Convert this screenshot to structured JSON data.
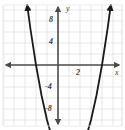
{
  "figure": {
    "name": "parabola-graph",
    "background_color": "#ffffff",
    "grid_color": "#dcdcdc",
    "axis_color": "#4a4a4a",
    "curve_color": "#1a1a1a",
    "plot_area": {
      "left": 4,
      "top": 5,
      "right": 122,
      "bottom": 126
    }
  },
  "axes": {
    "x_axis_label": "x",
    "y_axis_label": "y",
    "origin_px": {
      "x": 58,
      "y": 65
    },
    "unit_px": 11,
    "x_ticks": [
      {
        "value": 2,
        "label": "2"
      }
    ],
    "y_ticks": [
      {
        "value": 8,
        "label": "8"
      },
      {
        "value": 4,
        "label": "4"
      },
      {
        "value": -4,
        "label": "-4"
      },
      {
        "value": -8,
        "label": "-8"
      }
    ]
  },
  "chart_data": {
    "type": "line",
    "title": "",
    "subtitle": "",
    "xlabel": "x",
    "ylabel": "y",
    "xlim": [
      -5,
      6
    ],
    "ylim": [
      -11,
      11
    ],
    "grid": true,
    "legend": null,
    "series": [
      {
        "name": "y = x^2 - 2x - 8",
        "equation": "y = x^2 - 2x - 8",
        "vertex": [
          1,
          -9
        ],
        "roots": [
          -2,
          4
        ],
        "y_intercept": -8,
        "x": [
          -2.8,
          -2.5,
          -2,
          -1.5,
          -1,
          -0.5,
          0,
          0.5,
          1,
          1.5,
          2,
          2.5,
          3,
          3.5,
          4,
          4.5,
          4.8
        ],
        "values": [
          5.44,
          3.25,
          0,
          -2.75,
          -5,
          -6.75,
          -8,
          -8.75,
          -9,
          -8.75,
          -8,
          -6.75,
          -5,
          -2.75,
          0,
          3.25,
          5.44
        ]
      }
    ],
    "annotations": [
      {
        "text": "2",
        "x": 2,
        "y": 0,
        "role": "x-tick"
      },
      {
        "text": "8",
        "x": 0,
        "y": 8,
        "role": "y-tick"
      },
      {
        "text": "4",
        "x": 0,
        "y": 4,
        "role": "y-tick"
      },
      {
        "text": "-4",
        "x": 0,
        "y": -4,
        "role": "y-tick"
      },
      {
        "text": "-8",
        "x": 0,
        "y": -8,
        "role": "y-tick"
      },
      {
        "text": "x",
        "x": 5.7,
        "y": 0,
        "role": "axis-label"
      },
      {
        "text": "y",
        "x": 0,
        "y": 10.5,
        "role": "axis-label"
      }
    ]
  }
}
